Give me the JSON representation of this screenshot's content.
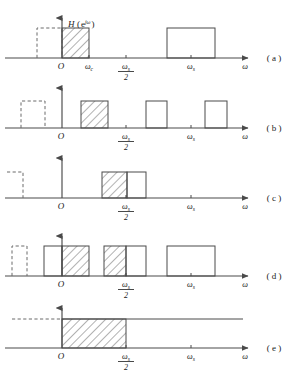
{
  "figure": {
    "title_label": "H",
    "title_arg_open": "(",
    "title_arg": "e",
    "title_arg_exp": "jω",
    "title_arg_close": ")",
    "axis_label_omega": "ω",
    "origin_label": "O",
    "tick_omega_c": "ω",
    "tick_omega_c_sub": "c",
    "tick_omega_s": "ω",
    "tick_omega_s_sub": "s",
    "frac_num": "ω",
    "frac_num_sub": "s",
    "frac_den": "2",
    "colors": {
      "stroke": "#4a4a4a",
      "dashed": "#6a6a6a",
      "text": "#1a1a1a",
      "background": "#ffffff"
    },
    "panels": [
      {
        "tag": "( a )",
        "baseline_y": 58,
        "shapes": [
          {
            "kind": "dashed-rect",
            "x0": 37,
            "x1": 62,
            "top": 28
          },
          {
            "kind": "hatched-rect",
            "x0": 62,
            "x1": 89,
            "top": 28
          },
          {
            "kind": "plain-rect",
            "x0": 167,
            "x1": 215,
            "top": 28
          }
        ],
        "ticks": [
          "omega_c",
          "omega_s_half",
          "omega_s"
        ]
      },
      {
        "tag": "( b )",
        "baseline_y": 128,
        "shapes": [
          {
            "kind": "dashed-rect",
            "x0": 21,
            "x1": 45,
            "top": 101
          },
          {
            "kind": "hatched-rect",
            "x0": 81,
            "x1": 108,
            "top": 101
          },
          {
            "kind": "plain-rect",
            "x0": 146,
            "x1": 167,
            "top": 101
          },
          {
            "kind": "plain-rect",
            "x0": 205,
            "x1": 227,
            "top": 101
          }
        ],
        "ticks": [
          "omega_s_half",
          "omega_s"
        ]
      },
      {
        "tag": "( c )",
        "baseline_y": 198,
        "shapes": [
          {
            "kind": "dashed-rect-partial",
            "x0": 7,
            "x1": 23,
            "top": 172
          },
          {
            "kind": "hatched-rect",
            "x0": 102,
            "x1": 127,
            "top": 172
          },
          {
            "kind": "plain-rect",
            "x0": 127,
            "x1": 146,
            "top": 172
          }
        ],
        "ticks": [
          "omega_s_half",
          "omega_s"
        ]
      },
      {
        "tag": "( d )",
        "baseline_y": 276,
        "shapes": [
          {
            "kind": "dashed-rect",
            "x0": 12,
            "x1": 27,
            "top": 246
          },
          {
            "kind": "plain-rect",
            "x0": 44,
            "x1": 62,
            "top": 246
          },
          {
            "kind": "hatched-rect",
            "x0": 62,
            "x1": 89,
            "top": 246
          },
          {
            "kind": "hatched-rect",
            "x0": 104,
            "x1": 126,
            "top": 246
          },
          {
            "kind": "plain-rect",
            "x0": 126,
            "x1": 146,
            "top": 246
          },
          {
            "kind": "plain-rect",
            "x0": 167,
            "x1": 215,
            "top": 246
          }
        ],
        "ticks": [
          "omega_s_half",
          "omega_s"
        ]
      },
      {
        "tag": "( e )",
        "baseline_y": 348,
        "shapes": [
          {
            "kind": "dashed-line",
            "x0": 12,
            "x1": 62,
            "top": 319
          },
          {
            "kind": "hatched-rect",
            "x0": 62,
            "x1": 126,
            "top": 319
          },
          {
            "kind": "plain-line",
            "x0": 126,
            "x1": 243,
            "top": 319
          }
        ],
        "ticks": [
          "omega_s_half",
          "omega_s"
        ]
      }
    ],
    "geometry": {
      "axis_x_start": 5,
      "axis_x_end": 248,
      "origin_x": 62,
      "omega_c_x": 89,
      "omega_s_half_x": 126,
      "omega_s_x": 191,
      "y_axis_top_offset": 40
    }
  }
}
